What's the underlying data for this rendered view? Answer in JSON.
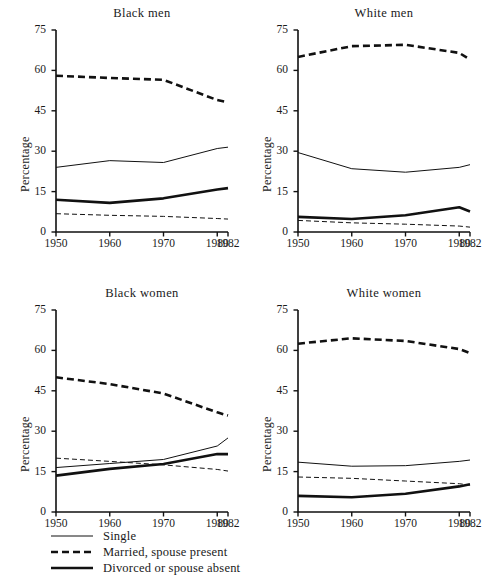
{
  "chart_data": {
    "type": "line",
    "xlabel": "",
    "ylabel": "Percentage",
    "xlim": [
      1950,
      1982
    ],
    "ylim": [
      0,
      75
    ],
    "yticks": [
      0,
      15,
      30,
      45,
      60,
      75
    ],
    "xticks": [
      1950,
      1960,
      1970,
      1980,
      1982
    ],
    "xtick_labels": [
      "1950",
      "1960",
      "1970",
      "1980",
      "1982"
    ],
    "grid": false,
    "legend_position": "bottom-left",
    "legend": [
      {
        "label": "Single",
        "style": "thin-solid"
      },
      {
        "label": "Married, spouse present",
        "style": "thick-dashed"
      },
      {
        "label": "Divorced or spouse absent",
        "style": "thick-solid"
      }
    ],
    "panels": [
      {
        "title": "Black men",
        "x": [
          1950,
          1960,
          1970,
          1980,
          1982
        ],
        "series": [
          {
            "name": "Single",
            "style": "thin-solid",
            "values": [
              24.0,
              26.5,
              25.8,
              31.0,
              31.5
            ]
          },
          {
            "name": "Married, spouse present",
            "style": "thick-dashed",
            "values": [
              58.0,
              57.2,
              56.5,
              49.0,
              48.2
            ]
          },
          {
            "name": "Divorced or spouse absent",
            "style": "thick-solid",
            "values": [
              12.0,
              10.8,
              12.5,
              15.8,
              16.3
            ]
          },
          {
            "name": "Widowed",
            "style": "thin-dashed",
            "values": [
              6.8,
              6.2,
              5.8,
              5.0,
              4.8
            ]
          }
        ]
      },
      {
        "title": "White men",
        "x": [
          1950,
          1960,
          1970,
          1980,
          1982
        ],
        "series": [
          {
            "name": "Single",
            "style": "thin-solid",
            "values": [
              29.5,
              23.5,
              22.2,
              24.0,
              25.0
            ]
          },
          {
            "name": "Married, spouse present",
            "style": "thick-dashed",
            "values": [
              65.0,
              69.0,
              69.5,
              66.5,
              64.0
            ]
          },
          {
            "name": "Divorced or spouse absent",
            "style": "thick-solid",
            "values": [
              5.6,
              4.8,
              6.2,
              9.2,
              7.6
            ]
          },
          {
            "name": "Widowed",
            "style": "thin-dashed",
            "values": [
              4.3,
              3.4,
              2.9,
              2.2,
              1.8
            ]
          }
        ]
      },
      {
        "title": "Black women",
        "x": [
          1950,
          1960,
          1970,
          1980,
          1982
        ],
        "series": [
          {
            "name": "Single",
            "style": "thin-solid",
            "values": [
              16.5,
              18.0,
              19.5,
              24.5,
              27.5
            ]
          },
          {
            "name": "Married, spouse present",
            "style": "thick-dashed",
            "values": [
              50.0,
              47.5,
              44.0,
              37.0,
              35.8
            ]
          },
          {
            "name": "Divorced or spouse absent",
            "style": "thick-solid",
            "values": [
              13.5,
              16.0,
              17.8,
              21.5,
              21.5
            ]
          },
          {
            "name": "Widowed",
            "style": "thin-dashed",
            "values": [
              20.0,
              18.8,
              17.5,
              15.8,
              15.2
            ]
          }
        ]
      },
      {
        "title": "White women",
        "x": [
          1950,
          1960,
          1970,
          1980,
          1982
        ],
        "series": [
          {
            "name": "Single",
            "style": "thin-solid",
            "values": [
              18.5,
              17.0,
              17.2,
              18.8,
              19.3
            ]
          },
          {
            "name": "Married, spouse present",
            "style": "thick-dashed",
            "values": [
              62.5,
              64.5,
              63.5,
              60.5,
              59.0
            ]
          },
          {
            "name": "Divorced or spouse absent",
            "style": "thick-solid",
            "values": [
              6.0,
              5.5,
              6.8,
              9.5,
              10.3
            ]
          },
          {
            "name": "Widowed",
            "style": "thin-dashed",
            "values": [
              13.0,
              12.5,
              11.5,
              10.5,
              10.0
            ]
          }
        ]
      }
    ]
  }
}
